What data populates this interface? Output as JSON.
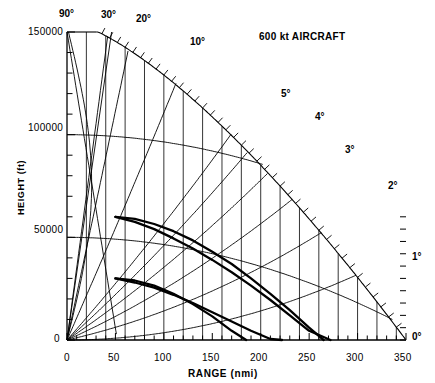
{
  "chart_data": {
    "type": "line",
    "title": "600 kt AIRCRAFT",
    "xlabel": "RANGE (nmi)",
    "ylabel": "HEIGHT (ft)",
    "xlim": [
      0,
      350
    ],
    "ylim": [
      0,
      150000
    ],
    "x_ticks_major": [
      0,
      50,
      100,
      150,
      200,
      250,
      300,
      350
    ],
    "x_tick_labels": [
      "0",
      "50",
      "100",
      "150",
      "200",
      "250",
      "300",
      "350"
    ],
    "x_tick_minor_step": 10,
    "y_ticks_major": [
      0,
      50000,
      100000,
      150000
    ],
    "y_tick_labels": [
      "0",
      "50000",
      "100000",
      "150000"
    ],
    "y_tick_minor_step": 10000,
    "grid": "vertical lines every 20 nmi; constant-height arcs at 50000 and 100000 ft",
    "legend_position": "none",
    "elevation_angle_labels": [
      "90",
      "30",
      "20",
      "10",
      "5",
      "4",
      "3",
      "2",
      "1",
      "0"
    ],
    "elevation_angle_unit": "degrees",
    "elevation_angles_deg": [
      0,
      1,
      2,
      3,
      4,
      5,
      10,
      20,
      30,
      90
    ],
    "series": [
      {
        "name": "upper-aircraft-trajectory-a",
        "comment": "heavy curve pair, starts 50 nmi / 60000 ft",
        "x": [
          50,
          70,
          90,
          110,
          130,
          150,
          170,
          190,
          210,
          230,
          250,
          265
        ],
        "y": [
          60000,
          59000,
          56500,
          53000,
          48500,
          43000,
          37000,
          30000,
          22500,
          14500,
          6000,
          0
        ]
      },
      {
        "name": "upper-aircraft-trajectory-b",
        "comment": "heavy curve pair, lower companion of upper pair",
        "x": [
          50,
          70,
          90,
          110,
          130,
          150,
          170,
          190,
          210,
          230,
          250,
          272
        ],
        "y": [
          60000,
          57500,
          54000,
          49500,
          44500,
          39000,
          33000,
          26500,
          19500,
          12000,
          4500,
          0
        ]
      },
      {
        "name": "lower-aircraft-trajectory-a",
        "comment": "heavy curve pair, starts 50 nmi / 30000 ft",
        "x": [
          50,
          70,
          90,
          110,
          130,
          150,
          170,
          185
        ],
        "y": [
          30000,
          29000,
          26500,
          22500,
          17500,
          11500,
          4500,
          0
        ]
      },
      {
        "name": "lower-aircraft-trajectory-b",
        "comment": "heavy curve pair, lower companion of lower pair",
        "x": [
          50,
          70,
          90,
          110,
          130,
          150,
          170,
          190,
          210,
          222
        ],
        "y": [
          30000,
          28000,
          25500,
          22000,
          18000,
          13500,
          9000,
          4500,
          500,
          0
        ]
      }
    ]
  },
  "axes": {
    "y_axis_title": "HEIGHT (ft)",
    "x_axis_title": "RANGE (nmi)",
    "y_tick_labels": [
      "150000",
      "100000",
      "50000",
      "0"
    ],
    "x_tick_labels": [
      "0",
      "50",
      "100",
      "150",
      "200",
      "250",
      "300",
      "350"
    ]
  },
  "annotations": {
    "title": "600 kt AIRCRAFT",
    "angles": [
      {
        "label": "90°"
      },
      {
        "label": "30°"
      },
      {
        "label": "20°"
      },
      {
        "label": "10°"
      },
      {
        "label": "5°"
      },
      {
        "label": "4°"
      },
      {
        "label": "3°"
      },
      {
        "label": "2°"
      },
      {
        "label": "1°"
      },
      {
        "label": "0°"
      }
    ]
  },
  "colors": {
    "ink": "#000000",
    "background": "#ffffff"
  }
}
